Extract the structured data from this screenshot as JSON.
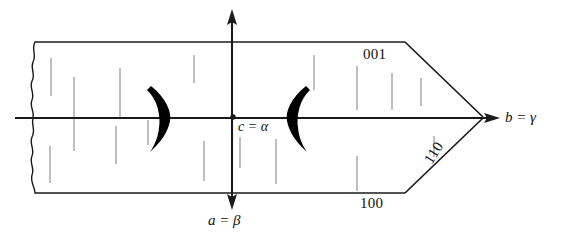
{
  "figure": {
    "type": "line-diagram",
    "background_color": "#ffffff",
    "line_color": "#1a1a1a",
    "striation_color": "#8a8a8a",
    "canvas": {
      "width": 569,
      "height": 237
    }
  },
  "axes": {
    "horizontal": {
      "label": "b = γ",
      "direction": "right",
      "arrow": true,
      "start_x": 15,
      "end_x": 500,
      "y": 118
    },
    "vertical": {
      "label": "a = β",
      "direction": "down",
      "arrow_up": true,
      "arrow_down": true,
      "x": 232,
      "start_y": 10,
      "end_y": 208
    },
    "origin": {
      "label": "c = α",
      "x": 233,
      "y": 117,
      "marker": "dot"
    }
  },
  "face_indices": [
    {
      "label": "001",
      "position": "upper-right-face",
      "rotation": 0
    },
    {
      "label": "110",
      "position": "lower-right-taper",
      "rotation": -58
    },
    {
      "label": "100",
      "position": "lower-face",
      "rotation": 0
    }
  ],
  "crystal": {
    "outline_points": "35,42 405,42 483,118 405,193 35,193",
    "left_edge": "irregular-broken",
    "taper_apex_x": 483,
    "taper_apex_y": 118
  },
  "optic_figure": {
    "description": "Two thick isogyre arcs (brushes) flanking the optic centre",
    "left_brush": {
      "cx": 158,
      "cy": 118,
      "opens": "left"
    },
    "right_brush": {
      "cx": 297,
      "cy": 118,
      "opens": "right"
    }
  },
  "striations": {
    "count": 17,
    "orientation": "vertical",
    "lines": [
      {
        "x": 51,
        "y1": 58,
        "y2": 96
      },
      {
        "x": 74,
        "y1": 77,
        "y2": 118
      },
      {
        "x": 120,
        "y1": 68,
        "y2": 118
      },
      {
        "x": 194,
        "y1": 55,
        "y2": 83
      },
      {
        "x": 314,
        "y1": 55,
        "y2": 90
      },
      {
        "x": 357,
        "y1": 66,
        "y2": 110
      },
      {
        "x": 392,
        "y1": 73,
        "y2": 110
      },
      {
        "x": 421,
        "y1": 78,
        "y2": 106
      },
      {
        "x": 50,
        "y1": 146,
        "y2": 183
      },
      {
        "x": 74,
        "y1": 118,
        "y2": 151
      },
      {
        "x": 116,
        "y1": 126,
        "y2": 164
      },
      {
        "x": 204,
        "y1": 141,
        "y2": 181
      },
      {
        "x": 276,
        "y1": 139,
        "y2": 184
      },
      {
        "x": 357,
        "y1": 156,
        "y2": 191
      },
      {
        "x": 434,
        "y1": 136,
        "y2": 157
      },
      {
        "x": 148,
        "y1": 120,
        "y2": 145
      },
      {
        "x": 240,
        "y1": 137,
        "y2": 168
      }
    ]
  }
}
